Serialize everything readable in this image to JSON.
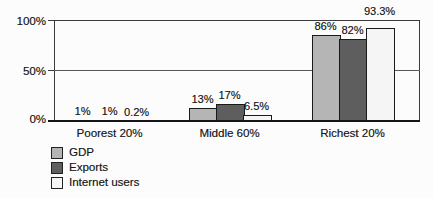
{
  "chart_data": {
    "type": "bar",
    "title": "",
    "categories": [
      "Poorest 20%",
      "Middle 60%",
      "Richest 20%"
    ],
    "series": [
      {
        "name": "GDP",
        "color": "#b5b5b5",
        "values": [
          1,
          13,
          86
        ],
        "data_labels": [
          "1%",
          "13%",
          "86%"
        ]
      },
      {
        "name": "Exports",
        "color": "#5e5e5e",
        "values": [
          1,
          17,
          82
        ],
        "data_labels": [
          "1%",
          "17%",
          "82%"
        ]
      },
      {
        "name": "Internet users",
        "color": "#f5f5f5",
        "values": [
          0.2,
          6.5,
          93.3
        ],
        "data_labels": [
          "0.2%",
          "6.5%",
          "93.3%"
        ]
      }
    ],
    "y_axis": {
      "tick_labels": [
        "100%",
        "50%",
        "0%"
      ],
      "min": 0,
      "max": 100,
      "gridlines": [
        50,
        100
      ]
    },
    "ylim": [
      0,
      100
    ],
    "legend": {
      "position": "bottom-left",
      "entries": [
        "GDP",
        "Exports",
        "Internet users"
      ]
    },
    "grid": "horizontal"
  },
  "colors": {
    "bar_border": "#1a1a1a",
    "axis_line": "#3c3c3c",
    "gridline_50": "#575757",
    "baseline": "#151515",
    "text": "#1a1a1a",
    "background": "#fcfcfc"
  }
}
